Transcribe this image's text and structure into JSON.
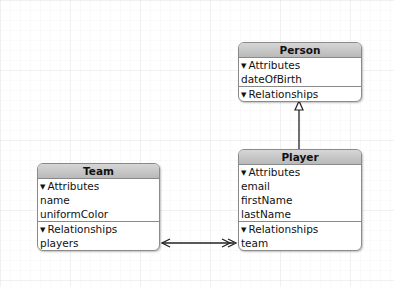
{
  "entities": {
    "person": {
      "title": "Person",
      "attributes_label": "Attributes",
      "attributes": [
        "dateOfBirth"
      ],
      "relationships_label": "Relationships",
      "relationships": []
    },
    "player": {
      "title": "Player",
      "attributes_label": "Attributes",
      "attributes": [
        "email",
        "firstName",
        "lastName"
      ],
      "relationships_label": "Relationships",
      "relationships": [
        "team"
      ]
    },
    "team": {
      "title": "Team",
      "attributes_label": "Attributes",
      "attributes": [
        "name",
        "uniformColor"
      ],
      "relationships_label": "Relationships",
      "relationships": [
        "players"
      ]
    }
  },
  "connections": [
    {
      "from": "Player",
      "to": "Person",
      "type": "inheritance"
    },
    {
      "from": "Team.players",
      "to": "Player.team",
      "type": "to-many / to-one inverse"
    }
  ],
  "icons": {
    "disclosure": "▼"
  }
}
